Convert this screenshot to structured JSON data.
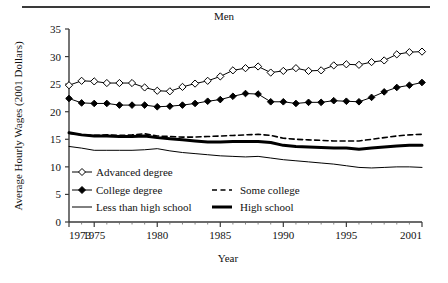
{
  "chart_data": {
    "type": "line",
    "title": "Men",
    "xlabel": "Year",
    "ylabel": "Average Hourly Wages (2001 Dollars)",
    "xlim": [
      1973,
      2001
    ],
    "ylim": [
      0,
      35
    ],
    "yticks": [
      0,
      5,
      10,
      15,
      20,
      25,
      30,
      35
    ],
    "ytick_labels": [
      "0",
      "5",
      "10",
      "15",
      "20",
      "25",
      "30",
      "35"
    ],
    "xticks": [
      1973,
      1975,
      1980,
      1985,
      1990,
      1995,
      2001
    ],
    "xtick_labels": [
      "1973",
      "1975",
      "1980",
      "1985",
      "1990",
      "1995",
      "2001"
    ],
    "minor_xticks": [
      1974,
      1976,
      1977,
      1978,
      1979,
      1981,
      1982,
      1983,
      1984,
      1986,
      1987,
      1988,
      1989,
      1991,
      1992,
      1993,
      1994,
      1996,
      1997,
      1998,
      1999,
      2000
    ],
    "grid": false,
    "legend_position": "inside-lower-left",
    "x": [
      1973,
      1974,
      1975,
      1976,
      1977,
      1978,
      1979,
      1980,
      1981,
      1982,
      1983,
      1984,
      1985,
      1986,
      1987,
      1988,
      1989,
      1990,
      1991,
      1992,
      1993,
      1994,
      1995,
      1996,
      1997,
      1998,
      1999,
      2000,
      2001
    ],
    "series": [
      {
        "name": "Advanced degree",
        "marker": "open-diamond",
        "line_style": "solid",
        "line_width": 1,
        "color": "#000000",
        "values": [
          24.8,
          25.6,
          25.5,
          25.2,
          25.2,
          25.2,
          24.4,
          23.8,
          23.7,
          24.5,
          25.1,
          25.6,
          26.4,
          27.5,
          27.9,
          28.2,
          27.1,
          27.4,
          27.9,
          27.4,
          27.5,
          28.4,
          28.6,
          28.5,
          29.0,
          29.3,
          30.4,
          30.8,
          30.9
        ]
      },
      {
        "name": "College degree",
        "marker": "filled-diamond",
        "line_style": "solid",
        "line_width": 1,
        "color": "#000000",
        "values": [
          22.4,
          21.6,
          21.5,
          21.5,
          21.2,
          21.2,
          21.2,
          20.9,
          21.0,
          21.2,
          21.5,
          21.9,
          22.2,
          22.8,
          23.3,
          23.2,
          21.8,
          21.8,
          21.5,
          21.7,
          21.7,
          22.0,
          21.9,
          21.8,
          22.6,
          23.6,
          24.4,
          24.8,
          25.3
        ]
      },
      {
        "name": "Some college",
        "marker": "none",
        "line_style": "dashed",
        "line_width": 1.6,
        "color": "#000000",
        "values": [
          16.1,
          15.8,
          15.7,
          15.8,
          15.7,
          15.8,
          16.0,
          15.6,
          15.5,
          15.4,
          15.4,
          15.5,
          15.6,
          15.7,
          15.8,
          15.9,
          15.7,
          15.2,
          15.0,
          14.9,
          14.8,
          14.7,
          14.7,
          14.7,
          15.0,
          15.3,
          15.6,
          15.8,
          15.9
        ]
      },
      {
        "name": "High school",
        "marker": "none",
        "line_style": "solid",
        "line_width": 3,
        "color": "#000000",
        "values": [
          16.2,
          15.8,
          15.6,
          15.6,
          15.5,
          15.5,
          15.6,
          15.3,
          15.1,
          14.9,
          14.7,
          14.5,
          14.5,
          14.6,
          14.6,
          14.6,
          14.4,
          13.9,
          13.7,
          13.6,
          13.5,
          13.4,
          13.4,
          13.2,
          13.4,
          13.6,
          13.8,
          13.9,
          13.9
        ]
      },
      {
        "name": "Less than high school",
        "marker": "none",
        "line_style": "solid",
        "line_width": 1,
        "color": "#000000",
        "values": [
          13.7,
          13.4,
          13.0,
          13.0,
          13.0,
          13.0,
          13.1,
          13.3,
          12.9,
          12.6,
          12.4,
          12.2,
          12.0,
          11.9,
          11.8,
          11.9,
          11.6,
          11.3,
          11.1,
          10.9,
          10.7,
          10.5,
          10.2,
          9.9,
          9.8,
          9.9,
          10.0,
          10.0,
          9.9
        ]
      }
    ]
  },
  "legend": {
    "entries": [
      {
        "label": "Advanced degree",
        "style": "open-diamond-line"
      },
      {
        "label": "College degree",
        "style": "filled-diamond-line"
      },
      {
        "label": "Some college",
        "style": "dashed-line"
      },
      {
        "label": "Less than high school",
        "style": "thin-line"
      },
      {
        "label": "High school",
        "style": "thick-line"
      }
    ]
  }
}
